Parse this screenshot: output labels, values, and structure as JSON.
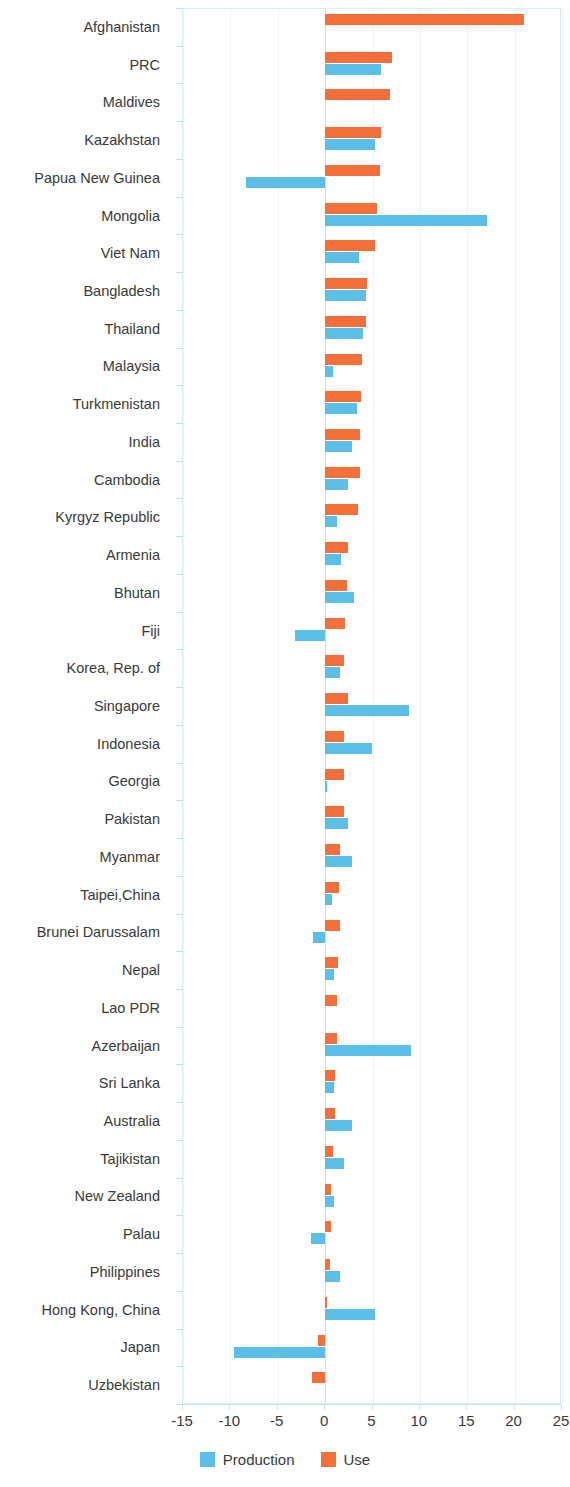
{
  "chart_data": {
    "type": "bar",
    "orientation": "horizontal",
    "title": "",
    "subtitle": "",
    "xlabel": "",
    "ylabel": "",
    "xlim": [
      -15,
      25
    ],
    "xticks": [
      -15,
      -10,
      -5,
      0,
      5,
      10,
      15,
      20,
      25
    ],
    "xticklabels": [
      "-15",
      "-10",
      "-5",
      "0",
      "5",
      "10",
      "15",
      "20",
      "25"
    ],
    "grid": true,
    "legend_position": "bottom",
    "colors": {
      "production": "#5BBFE8",
      "use": "#F4703A",
      "grid": "#eaf6fb",
      "axis": "#bfe4f2",
      "text": "#3a3a3a"
    },
    "categories": [
      "Afghanistan",
      "PRC",
      "Maldives",
      "Kazakhstan",
      "Papua New Guinea",
      "Mongolia",
      "Viet Nam",
      "Bangladesh",
      "Thailand",
      "Malaysia",
      "Turkmenistan",
      "India",
      "Cambodia",
      "Kyrgyz Republic",
      "Armenia",
      "Bhutan",
      "Fiji",
      "Korea, Rep. of",
      "Singapore",
      "Indonesia",
      "Georgia",
      "Pakistan",
      "Myanmar",
      "Taipei,China",
      "Brunei Darussalam",
      "Nepal",
      "Lao PDR",
      "Azerbaijan",
      "Sri Lanka",
      "Australia",
      "Tajikistan",
      "New Zealand",
      "Palau",
      "Philippines",
      "Hong Kong, China",
      "Japan",
      "Uzbekistan"
    ],
    "series": [
      {
        "name": "Production",
        "color": "#5BBFE8",
        "values": [
          0.0,
          5.9,
          0.0,
          5.3,
          -8.3,
          17.1,
          3.6,
          4.3,
          4.0,
          0.8,
          3.4,
          2.8,
          2.4,
          1.3,
          1.7,
          3.1,
          -3.2,
          1.6,
          8.9,
          4.9,
          0.2,
          2.4,
          2.8,
          0.7,
          -1.3,
          0.9,
          0.0,
          9.1,
          0.9,
          2.8,
          2.0,
          0.9,
          -1.5,
          1.6,
          5.3,
          -9.6,
          0.0
        ]
      },
      {
        "name": "Use",
        "color": "#F4703A",
        "values": [
          21.0,
          7.1,
          6.8,
          5.9,
          5.8,
          5.5,
          5.3,
          4.4,
          4.3,
          3.9,
          3.8,
          3.7,
          3.7,
          3.5,
          2.4,
          2.3,
          2.1,
          2.0,
          2.4,
          2.0,
          2.0,
          2.0,
          1.6,
          1.5,
          1.6,
          1.4,
          1.3,
          1.3,
          1.0,
          1.0,
          0.8,
          0.6,
          0.6,
          0.5,
          0.2,
          -0.8,
          -1.4
        ]
      }
    ]
  },
  "legend": {
    "items": [
      {
        "label": "Production",
        "color": "#5BBFE8"
      },
      {
        "label": "Use",
        "color": "#F4703A"
      }
    ]
  }
}
